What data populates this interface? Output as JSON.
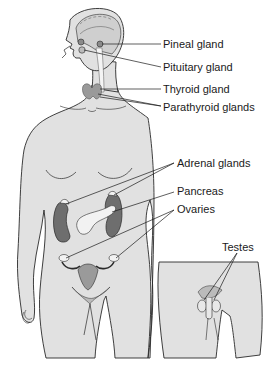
{
  "diagram": {
    "colors": {
      "skin": "#e1e1e1",
      "outline": "#2a2a2a",
      "brain": "#cfcfcf",
      "gland_dark": "#6e6e6e",
      "gland_mid": "#9a9a9a",
      "gland_light": "#f2f2f2"
    },
    "labels": [
      {
        "id": "pineal",
        "text": "Pineal gland"
      },
      {
        "id": "pituitary",
        "text": "Pituitary gland"
      },
      {
        "id": "thyroid",
        "text": "Thyroid gland"
      },
      {
        "id": "parathyroid",
        "text": "Parathyroid glands"
      },
      {
        "id": "adrenal",
        "text": "Adrenal glands"
      },
      {
        "id": "pancreas",
        "text": "Pancreas"
      },
      {
        "id": "ovaries",
        "text": "Ovaries"
      },
      {
        "id": "testes",
        "text": "Testes"
      }
    ]
  }
}
